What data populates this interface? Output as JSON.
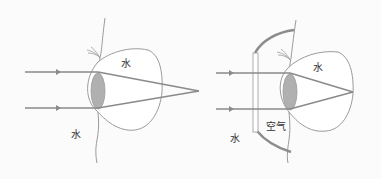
{
  "diagram": {
    "left_panel": {
      "description": "Eye under water without goggles",
      "labels": {
        "eye_interior": "水",
        "outside_water": "水"
      }
    },
    "right_panel": {
      "description": "Eye under water with goggles (air gap)",
      "labels": {
        "eye_interior": "水",
        "outside_water": "水",
        "goggle_air": "空气"
      }
    },
    "colors": {
      "ray": "#8a8a8a",
      "outline": "#9a9a9a",
      "lens_fill": "#b0b0b0",
      "goggle_frame": "#8c8c8c",
      "background": "#fbfbfb"
    }
  }
}
